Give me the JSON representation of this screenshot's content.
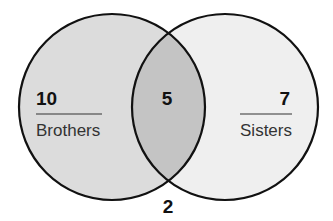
{
  "diagram": {
    "type": "venn",
    "sets": [
      {
        "name": "Brothers",
        "label": "Brothers",
        "only_count": "10",
        "fill": "#dcdcdc"
      },
      {
        "name": "Sisters",
        "label": "Sisters",
        "only_count": "7",
        "fill": "#efefef"
      }
    ],
    "intersection": {
      "count": "5",
      "fill": "#c4c4c4"
    },
    "outside": {
      "count": "2"
    },
    "stroke_color": "#111111"
  }
}
